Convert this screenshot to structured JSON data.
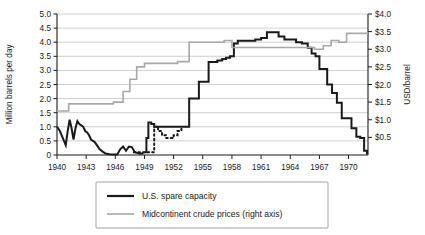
{
  "chart_data": {
    "type": "line",
    "title": "",
    "xlabel": "",
    "ylabel": "Million barrels per day",
    "y2label": "USD/barrel",
    "grid": true,
    "legend_position": "bottom",
    "xlim": [
      1940,
      1972
    ],
    "ylim": [
      0,
      5.0
    ],
    "y2lim": [
      0,
      4.0
    ],
    "x_ticks": [
      1940,
      1943,
      1946,
      1949,
      1952,
      1955,
      1958,
      1961,
      1964,
      1967,
      1970
    ],
    "x_tick_labels": [
      "1940",
      "1943",
      "1946",
      "1949",
      "1952",
      "1955",
      "1958",
      "1961",
      "1964",
      "1967",
      "1970"
    ],
    "y_ticks": [
      0,
      0.5,
      1.0,
      1.5,
      2.0,
      2.5,
      3.0,
      3.5,
      4.0,
      4.5,
      5.0
    ],
    "y_tick_labels": [
      "0",
      "0.5",
      "1.0",
      "1.5",
      "2.0",
      "2.5",
      "3.0",
      "3.5",
      "4.0",
      "4.5",
      "5.0"
    ],
    "y2_ticks": [
      0,
      0.5,
      1.0,
      1.5,
      2.0,
      2.5,
      3.0,
      3.5,
      4.0
    ],
    "y2_tick_labels": [
      "",
      "$0.5",
      "$1.0",
      "$1.5",
      "$2.0",
      "$2.5",
      "$3.0",
      "$3.5",
      "$4.0"
    ],
    "series": [
      {
        "name": "U.S. spare capacity",
        "axis": "left",
        "color": "#1a1a1a",
        "style": "solid",
        "x": [
          1940.0,
          1940.3,
          1940.6,
          1940.9,
          1941.1,
          1941.3,
          1941.5,
          1941.7,
          1941.9,
          1942.1,
          1942.3,
          1942.5,
          1942.7,
          1942.9,
          1943.1,
          1943.3,
          1943.5,
          1943.7,
          1943.9,
          1944.1,
          1944.4,
          1944.7,
          1945.0,
          1945.4,
          1945.8,
          1946.2,
          1946.5,
          1946.8,
          1947.1,
          1947.4,
          1947.7,
          1948.0,
          1948.5,
          1948.9
        ],
        "y": [
          1.0,
          0.85,
          0.6,
          0.35,
          0.85,
          1.25,
          0.95,
          0.55,
          0.95,
          1.2,
          1.1,
          1.05,
          1.0,
          0.85,
          0.8,
          0.7,
          0.55,
          0.5,
          0.45,
          0.35,
          0.2,
          0.12,
          0.05,
          0.03,
          0.02,
          0.02,
          0.2,
          0.3,
          0.15,
          0.3,
          0.28,
          0.1,
          0.05,
          0.05
        ]
      },
      {
        "name": "U.S. spare capacity (continued)",
        "axis": "left",
        "color": "#1a1a1a",
        "style": "solid",
        "x": [
          1949.0,
          1949.2,
          1949.4,
          1949.7,
          1950.0,
          1952.8,
          1953.4,
          1953.6,
          1954.2,
          1954.6,
          1955.2,
          1955.6,
          1956.1,
          1956.5,
          1957.0,
          1957.4,
          1957.8,
          1958.2,
          1958.6,
          1959.2,
          1959.8,
          1960.4,
          1961.0,
          1961.6,
          1962.2,
          1962.8,
          1963.4,
          1964.0,
          1964.6,
          1965.2,
          1965.8,
          1966.2,
          1966.6,
          1967.0,
          1967.4,
          1967.8,
          1968.3,
          1968.8,
          1969.3,
          1969.8,
          1970.3,
          1970.8,
          1971.2,
          1971.6,
          1971.9,
          1972.0
        ],
        "y": [
          0.1,
          0.6,
          1.15,
          1.1,
          1.0,
          1.0,
          1.0,
          2.0,
          2.0,
          2.6,
          2.6,
          3.3,
          3.3,
          3.35,
          3.4,
          3.45,
          3.5,
          3.95,
          4.05,
          4.05,
          4.05,
          4.1,
          4.15,
          4.35,
          4.35,
          4.2,
          4.1,
          4.1,
          4.0,
          3.95,
          3.8,
          3.6,
          3.5,
          3.05,
          3.05,
          2.5,
          2.2,
          1.85,
          1.3,
          1.3,
          0.95,
          0.65,
          0.6,
          0.15,
          0.05,
          0.05
        ]
      },
      {
        "name": "U.S. spare capacity (dotted estimate)",
        "axis": "left",
        "color": "#1a1a1a",
        "style": "dotted",
        "x": [
          1947.9,
          1948.4,
          1950.0,
          1950.4,
          1950.8,
          1951.2,
          1951.6,
          1952.0,
          1952.4,
          1952.8
        ],
        "y": [
          0.1,
          0.1,
          1.0,
          0.85,
          0.7,
          0.6,
          0.6,
          0.7,
          0.85,
          1.0
        ]
      },
      {
        "name": "Midcontinent crude prices (right axis)",
        "axis": "right",
        "color": "#a8a8a8",
        "style": "solid",
        "x": [
          1940.0,
          1941.0,
          1941.2,
          1945.5,
          1945.8,
          1946.5,
          1946.8,
          1947.2,
          1947.5,
          1947.8,
          1948.2,
          1948.6,
          1949.0,
          1949.4,
          1952.0,
          1952.4,
          1953.2,
          1953.6,
          1956.8,
          1957.2,
          1957.6,
          1958.0,
          1958.4,
          1959.0,
          1960.0,
          1961.0,
          1961.5,
          1962.0,
          1963.0,
          1964.0,
          1965.0,
          1966.0,
          1966.5,
          1967.0,
          1967.4,
          1967.8,
          1968.2,
          1968.6,
          1969.0,
          1969.4,
          1969.8,
          1970.5,
          1972.0
        ],
        "y": [
          1.25,
          1.25,
          1.45,
          1.45,
          1.5,
          1.5,
          1.8,
          1.8,
          2.15,
          2.15,
          2.5,
          2.5,
          2.6,
          2.6,
          2.6,
          2.65,
          2.65,
          3.2,
          3.2,
          3.25,
          3.25,
          3.05,
          3.05,
          3.05,
          3.05,
          3.05,
          3.05,
          3.05,
          3.05,
          3.05,
          3.05,
          3.05,
          3.0,
          3.0,
          3.1,
          3.1,
          3.25,
          3.25,
          3.2,
          3.2,
          3.45,
          3.45,
          3.45
        ]
      }
    ],
    "legend": [
      {
        "label": "U.S. spare capacity",
        "color": "#1a1a1a",
        "swatch": "solid-black-line"
      },
      {
        "label": "Midcontinent crude prices (right axis)",
        "color": "#a8a8a8",
        "swatch": "solid-gray-line"
      }
    ]
  }
}
